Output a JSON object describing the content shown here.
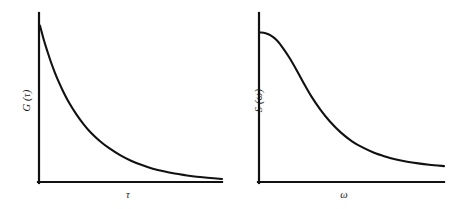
{
  "figure": {
    "background_color": "#ffffff",
    "line_color": "#111111",
    "width": 464,
    "height": 209
  },
  "panels": {
    "left": {
      "ylabel": "G (τ)",
      "xlabel": "τ"
    },
    "right": {
      "ylabel": "S (ω)",
      "xlabel": "ω"
    }
  },
  "chart_data": [
    {
      "type": "line",
      "title": "",
      "subtitle": "",
      "xlabel": "τ",
      "ylabel": "G (τ)",
      "xlim": [
        0,
        1
      ],
      "ylim": [
        0,
        1
      ],
      "grid": false,
      "legend": null,
      "tick_labels": {
        "x": [],
        "y": []
      },
      "annotations": [],
      "description": "Exponentially decaying autocorrelation function G(tau) = exp(-tau/tc); starts at maximum on the vertical axis and decays monotonically toward zero, asymptotically approaching the horizontal axis.",
      "series": [
        {
          "name": "G(tau)",
          "x": [
            0.0,
            0.02,
            0.04,
            0.06,
            0.08,
            0.1,
            0.13,
            0.16,
            0.2,
            0.24,
            0.28,
            0.33,
            0.38,
            0.44,
            0.5,
            0.56,
            0.62,
            0.68,
            0.74,
            0.8,
            0.86,
            0.92,
            1.0
          ],
          "values": [
            0.925,
            0.845,
            0.775,
            0.71,
            0.652,
            0.6,
            0.53,
            0.469,
            0.4,
            0.341,
            0.291,
            0.241,
            0.2,
            0.159,
            0.126,
            0.1,
            0.079,
            0.063,
            0.05,
            0.04,
            0.031,
            0.025,
            0.018
          ]
        }
      ]
    },
    {
      "type": "line",
      "title": "",
      "subtitle": "",
      "xlabel": "ω",
      "ylabel": "S (ω)",
      "xlim": [
        0,
        1
      ],
      "ylim": [
        0,
        1
      ],
      "grid": false,
      "legend": null,
      "tick_labels": {
        "x": [],
        "y": []
      },
      "annotations": [],
      "description": "Lorentzian spectral density S(omega); flat plateau at low frequency, inflection in the mid range, then a long slowly decaying tail that stays slightly above the horizontal axis.",
      "series": [
        {
          "name": "S(omega)",
          "x": [
            0.0,
            0.03,
            0.06,
            0.09,
            0.12,
            0.16,
            0.2,
            0.24,
            0.28,
            0.33,
            0.38,
            0.44,
            0.5,
            0.56,
            0.62,
            0.68,
            0.74,
            0.8,
            0.86,
            0.92,
            1.0
          ],
          "values": [
            0.885,
            0.88,
            0.866,
            0.84,
            0.8,
            0.735,
            0.66,
            0.58,
            0.505,
            0.425,
            0.358,
            0.292,
            0.241,
            0.203,
            0.173,
            0.151,
            0.133,
            0.12,
            0.11,
            0.102,
            0.094
          ]
        }
      ]
    }
  ]
}
